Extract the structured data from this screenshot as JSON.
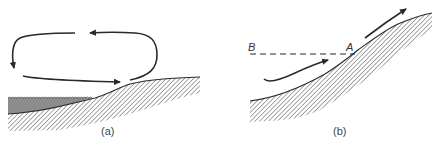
{
  "figure": {
    "panels": [
      {
        "id": "a",
        "caption": "(a)",
        "elements": [
          "circulation-loop-arrows",
          "water-body",
          "sloping-land-surface",
          "hatched-ground"
        ]
      },
      {
        "id": "b",
        "caption": "(b)",
        "labels": {
          "left_point": "B",
          "right_point": "A"
        },
        "elements": [
          "upslope-flow-arrow-lower",
          "upslope-flow-arrow-upper",
          "dashed-level-line",
          "hatched-slope-ground"
        ]
      }
    ],
    "colors": {
      "stroke": "#2a2a2a",
      "water_fill": "#8c8c8c",
      "hatch": "#3a3a3a",
      "background": "#ffffff"
    }
  }
}
